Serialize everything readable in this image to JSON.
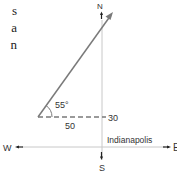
{
  "clipped_paragraph": {
    "line_endings": [
      "s",
      "a",
      "n"
    ]
  },
  "compass": {
    "north": "N",
    "south": "S",
    "west": "W",
    "east": "E"
  },
  "diagram": {
    "angle_label": "55°",
    "horizontal_component_label": "50",
    "vertical_offset_label": "30",
    "origin_label": "Indianapolis",
    "angle_degrees": 55,
    "line_color": "#7a7a7a",
    "axis_color": "#b5b5b5",
    "vector_color": "#7a7a7a"
  }
}
